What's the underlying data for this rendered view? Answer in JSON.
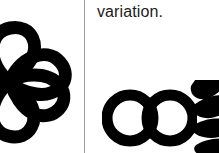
{
  "page": {
    "background_color": "#ffffff",
    "ink_color": "#000000",
    "width": 219,
    "height": 153
  },
  "left_panel": {
    "figure": {
      "icon_name": "clover-petal-logo",
      "description": "four rounded petals radiating from left edge, black outline, cropped at left",
      "petal_count": 4,
      "stroke_color": "#000000"
    }
  },
  "divider": {
    "icon_name": "vertical-divider",
    "color": "#9a9a9a",
    "x": 84
  },
  "right_panel": {
    "caption": {
      "text": "variation.",
      "color": "#1b1b1b"
    },
    "figure": {
      "icon_name": "double-ring-petal-logo",
      "description": "two interlocking black rings followed by a stack of petals cropped at the right edge",
      "ring_count": 2,
      "petal_count": 4,
      "stroke_color": "#000000"
    }
  }
}
